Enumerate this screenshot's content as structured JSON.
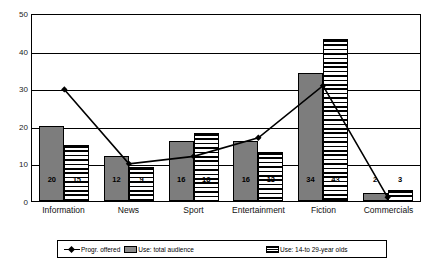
{
  "chart_data": {
    "type": "bar",
    "title": "",
    "xlabel": "",
    "ylabel": "",
    "ylim": [
      0,
      50
    ],
    "yticks": [
      0,
      10,
      20,
      30,
      40,
      50
    ],
    "grid": true,
    "legend_position": "bottom",
    "categories": [
      "Information",
      "News",
      "Sport",
      "Entertainment",
      "Fiction",
      "Commercials"
    ],
    "series": [
      {
        "name": "Progr. offered",
        "type": "line",
        "marker": "diamond",
        "color": "#000000",
        "values": [
          30,
          10,
          12,
          17,
          31,
          1
        ]
      },
      {
        "name": "Use: total audience",
        "type": "bar",
        "fill": "solid-gray",
        "color": "#7d7d7d",
        "values": [
          20,
          12,
          16,
          16,
          34,
          2
        ],
        "labels": [
          "20",
          "12",
          "16",
          "16",
          "34",
          "2"
        ]
      },
      {
        "name": "Use: 14-to 29-year olds",
        "type": "bar",
        "fill": "horizontal-stripes",
        "color": "#000000",
        "values": [
          15,
          9,
          18,
          13,
          43,
          3
        ],
        "labels": [
          "15",
          "9",
          "18",
          "13",
          "43",
          "3"
        ]
      }
    ]
  },
  "legend": {
    "items": [
      {
        "label": "Progr. offered",
        "icon": "line-diamond-marker"
      },
      {
        "label": "Use: total audience",
        "icon": "solid-gray-swatch"
      },
      {
        "label": "Use: 14-to 29-year olds",
        "icon": "striped-swatch"
      }
    ]
  }
}
